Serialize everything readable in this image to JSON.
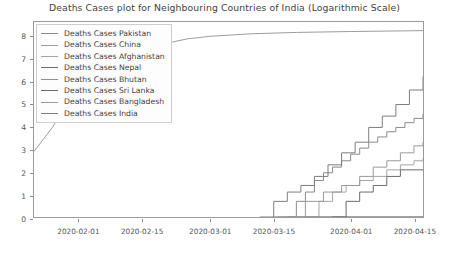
{
  "chart_data": {
    "type": "line",
    "title": "Deaths Cases plot for Neighbouring Countries of India (Logarithmic Scale)",
    "subtitle": "",
    "xlabel": "",
    "ylabel": "",
    "scale": "logarithmic",
    "grid": false,
    "legend_position": "upper left",
    "ylim": [
      0,
      8.6
    ],
    "yticks": [
      0,
      1,
      2,
      3,
      4,
      5,
      6,
      7,
      8
    ],
    "ytick_labels": [
      "0",
      "1",
      "2",
      "3",
      "4",
      "5",
      "6",
      "7",
      "8"
    ],
    "xlim": [
      "2020-01-22",
      "2020-04-17"
    ],
    "xticks": [
      "2020-02-01",
      "2020-02-15",
      "2020-03-01",
      "2020-03-15",
      "2020-04-01",
      "2020-04-15"
    ],
    "xtick_labels": [
      "2020-02-01",
      "2020-02-15",
      "2020-03-01",
      "2020-03-15",
      "2020-04-01",
      "2020-04-15"
    ],
    "legend": [
      "Deaths Cases Pakistan",
      "Deaths Cases China",
      "Deaths Cases Afghanistan",
      "Deaths Cases Nepal",
      "Deaths Cases Bhutan",
      "Deaths Cases Sri Lanka",
      "Deaths Cases Bangladesh",
      "Deaths Cases India"
    ],
    "series": [
      {
        "name": "Deaths Cases Pakistan",
        "color": "#8a8a8a",
        "x": [
          "2020-03-18",
          "2020-03-20",
          "2020-03-22",
          "2020-03-24",
          "2020-03-26",
          "2020-03-28",
          "2020-03-30",
          "2020-04-01",
          "2020-04-03",
          "2020-04-05",
          "2020-04-07",
          "2020-04-09",
          "2020-04-11",
          "2020-04-13",
          "2020-04-15",
          "2020-04-17"
        ],
        "values": [
          0.0,
          0.69,
          1.1,
          1.61,
          1.95,
          2.2,
          2.48,
          2.77,
          3.04,
          3.3,
          3.53,
          3.76,
          3.95,
          4.16,
          4.35,
          4.52
        ]
      },
      {
        "name": "Deaths Cases China",
        "color": "#9c9c9c",
        "x": [
          "2020-01-22",
          "2020-01-26",
          "2020-01-30",
          "2020-02-03",
          "2020-02-07",
          "2020-02-11",
          "2020-02-15",
          "2020-02-20",
          "2020-02-25",
          "2020-03-01",
          "2020-03-10",
          "2020-03-20",
          "2020-04-01",
          "2020-04-17"
        ],
        "values": [
          2.89,
          3.93,
          5.19,
          5.87,
          6.45,
          6.92,
          7.32,
          7.65,
          7.86,
          7.97,
          8.08,
          8.14,
          8.18,
          8.22
        ]
      },
      {
        "name": "Deaths Cases Afghanistan",
        "color": "#a5a5a5",
        "x": [
          "2020-03-22",
          "2020-03-25",
          "2020-03-28",
          "2020-03-31",
          "2020-04-03",
          "2020-04-06",
          "2020-04-09",
          "2020-04-12",
          "2020-04-15",
          "2020-04-17"
        ],
        "values": [
          0.0,
          0.69,
          1.1,
          1.39,
          1.61,
          1.79,
          2.08,
          2.3,
          2.48,
          2.56
        ]
      },
      {
        "name": "Deaths Cases Nepal",
        "color": "#6e6e6e",
        "x": [
          "2020-03-15",
          "2020-03-20",
          "2020-03-25",
          "2020-03-30",
          "2020-04-05",
          "2020-04-10",
          "2020-04-17"
        ],
        "values": [
          0.0,
          0.0,
          0.0,
          0.0,
          0.0,
          0.0,
          0.0
        ]
      },
      {
        "name": "Deaths Cases Bhutan",
        "color": "#8f8f8f",
        "x": [
          "2020-03-16",
          "2020-03-22",
          "2020-03-28",
          "2020-04-05",
          "2020-04-17"
        ],
        "values": [
          0.0,
          0.0,
          0.0,
          0.0,
          0.0
        ]
      },
      {
        "name": "Deaths Cases Sri Lanka",
        "color": "#6b6b6b",
        "x": [
          "2020-03-28",
          "2020-03-31",
          "2020-04-03",
          "2020-04-06",
          "2020-04-09",
          "2020-04-12",
          "2020-04-15",
          "2020-04-17"
        ],
        "values": [
          0.0,
          0.69,
          1.1,
          1.39,
          1.79,
          2.08,
          2.08,
          2.08
        ]
      },
      {
        "name": "Deaths Cases Bangladesh",
        "color": "#9a9a9a",
        "x": [
          "2020-03-18",
          "2020-03-22",
          "2020-03-26",
          "2020-03-30",
          "2020-04-03",
          "2020-04-06",
          "2020-04-09",
          "2020-04-12",
          "2020-04-15",
          "2020-04-17"
        ],
        "values": [
          0.0,
          0.69,
          1.1,
          1.39,
          1.79,
          2.2,
          2.48,
          2.83,
          3.14,
          3.3
        ]
      },
      {
        "name": "Deaths Cases India",
        "color": "#7d7d7d",
        "x": [
          "2020-03-12",
          "2020-03-15",
          "2020-03-18",
          "2020-03-21",
          "2020-03-24",
          "2020-03-27",
          "2020-03-30",
          "2020-04-02",
          "2020-04-05",
          "2020-04-08",
          "2020-04-11",
          "2020-04-14",
          "2020-04-17"
        ],
        "values": [
          0.0,
          0.69,
          1.1,
          1.39,
          1.79,
          2.3,
          2.83,
          3.3,
          3.95,
          4.45,
          4.96,
          5.6,
          6.18
        ]
      }
    ]
  },
  "figure": {
    "background": "#ffffff",
    "axes_border_color": "#9a9a9a",
    "tick_color": "#8c8c8c",
    "text_color": "#444444"
  }
}
